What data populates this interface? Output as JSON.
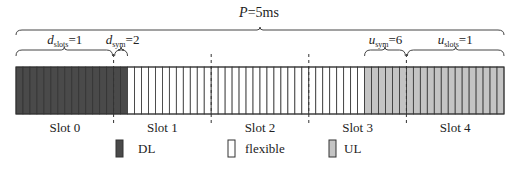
{
  "diagram": {
    "period_label": {
      "var": "P",
      "value": "=5ms"
    },
    "total_slots": 5,
    "symbols_per_slot": 14,
    "dl": {
      "slots_label": {
        "var": "d",
        "sub": "slots",
        "value": "=1"
      },
      "sym_label": {
        "var": "d",
        "sub": "sym",
        "value": "=2"
      },
      "slots": 1,
      "symbols": 2
    },
    "ul": {
      "sym_label": {
        "var": "u",
        "sub": "sym",
        "value": "=6"
      },
      "slots_label": {
        "var": "u",
        "sub": "slots",
        "value": "=1"
      },
      "slots": 1,
      "symbols": 6
    },
    "slot_labels": [
      "Slot 0",
      "Slot 1",
      "Slot 2",
      "Slot 3",
      "Slot 4"
    ],
    "legend": [
      {
        "key": "dl",
        "label": "DL",
        "color": "#4a4a4a"
      },
      {
        "key": "flexible",
        "label": "flexible",
        "color": "#ffffff"
      },
      {
        "key": "ul",
        "label": "UL",
        "color": "#c4c4c4"
      }
    ],
    "colors": {
      "dl": "#4a4a4a",
      "flexible": "#ffffff",
      "ul": "#c4c4c4",
      "line": "#333333"
    }
  }
}
